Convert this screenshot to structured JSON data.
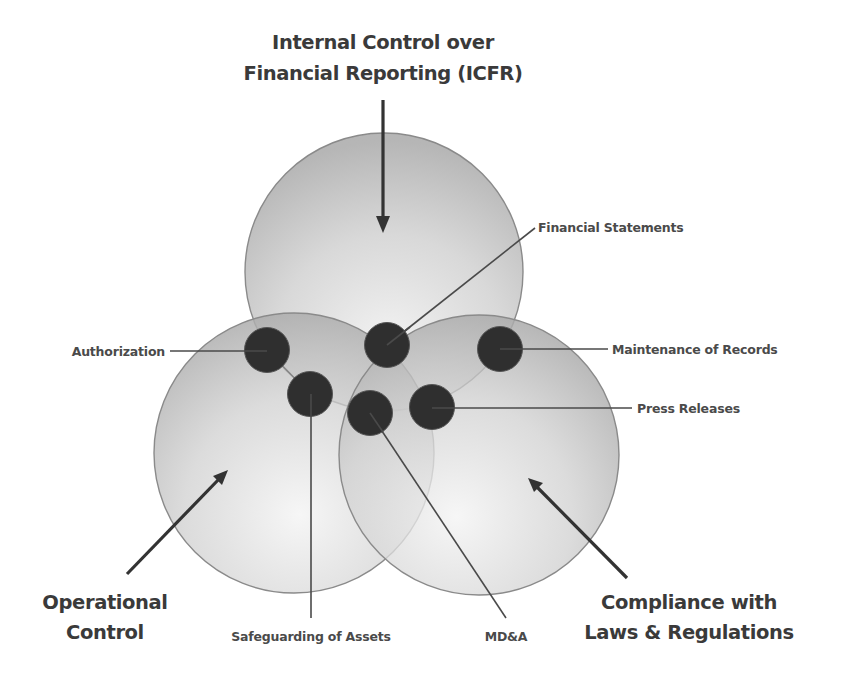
{
  "diagram": {
    "title_line1": "Internal Control over",
    "title_line2": "Financial Reporting (ICFR)",
    "circles": [
      {
        "id": "icfr",
        "label": "Internal Control over Financial Reporting (ICFR)"
      },
      {
        "id": "operational",
        "label": "Operational Control"
      },
      {
        "id": "compliance",
        "label": "Compliance with Laws & Regulations"
      }
    ],
    "operational_line1": "Operational",
    "operational_line2": "Control",
    "compliance_line1": "Compliance with",
    "compliance_line2": "Laws & Regulations",
    "items": {
      "authorization": "Authorization",
      "financial_statements": "Financial Statements",
      "maintenance_of_records": "Maintenance of Records",
      "press_releases": "Press Releases",
      "safeguarding_of_assets": "Safeguarding of Assets",
      "mdna": "MD&A"
    },
    "colors": {
      "circle_fill": "#b5b5b5",
      "circle_edge": "#8a8a8a",
      "dot_fill": "#2f2f2f",
      "text": "#3a3a3a",
      "arrow": "#333333"
    }
  }
}
